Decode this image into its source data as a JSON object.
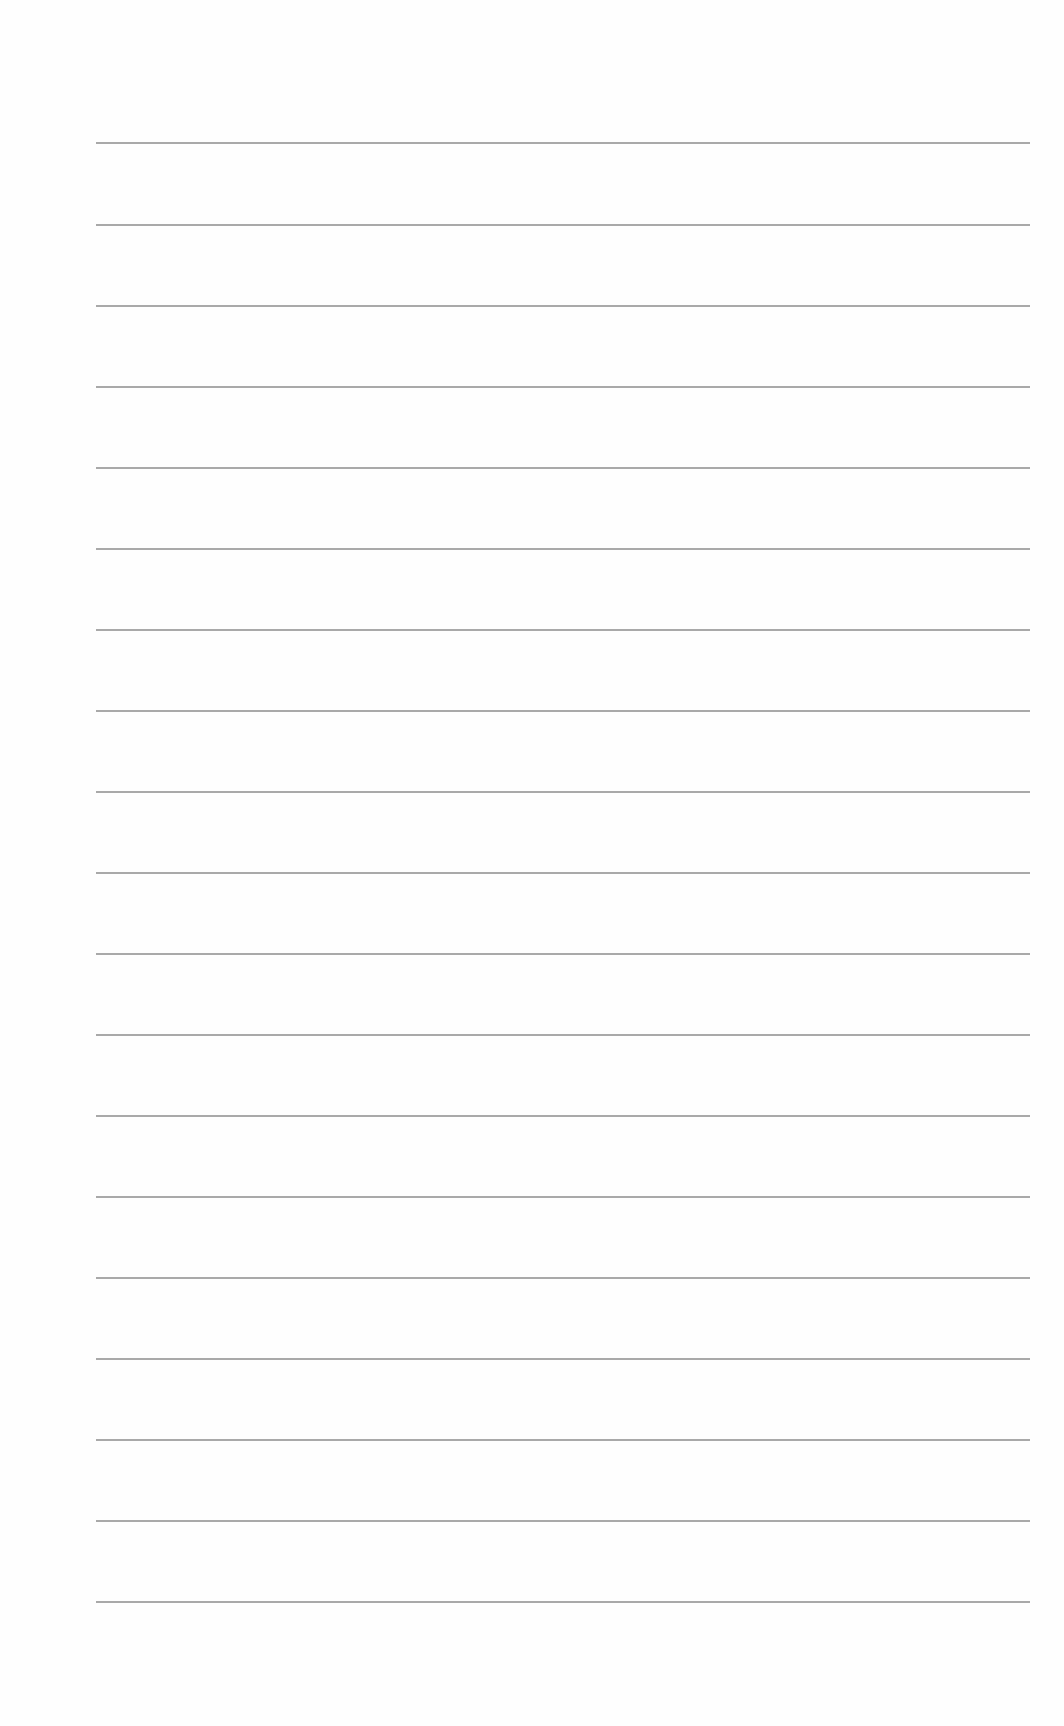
{
  "page": {
    "type": "blank-lined-paper",
    "background_color": "#ffffff",
    "line_color": "#9a9a9a",
    "line_count": 19,
    "line_left": 96,
    "line_right": 1030,
    "lines_y": [
      142,
      224,
      305,
      386,
      467,
      548,
      629,
      710,
      791,
      872,
      953,
      1034,
      1115,
      1196,
      1277,
      1358,
      1439,
      1520,
      1601
    ]
  }
}
